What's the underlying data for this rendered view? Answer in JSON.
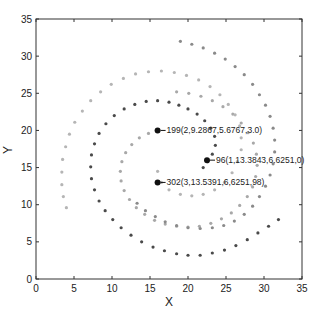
{
  "chart_data": {
    "type": "scatter",
    "title": "",
    "xlabel": "X",
    "ylabel": "Y",
    "xlim": [
      0,
      35
    ],
    "ylim": [
      0,
      35
    ],
    "xticks": [
      0,
      5,
      10,
      15,
      20,
      25,
      30,
      35
    ],
    "yticks": [
      0,
      5,
      10,
      15,
      20,
      25,
      30,
      35
    ],
    "grid": false,
    "legend": null,
    "series": [
      {
        "name": "spiral-1-inner-dark",
        "color": "#4a4a4a",
        "marker": "dot",
        "description": "Short dark arc from (22,15) up through (24,19) to (16,20)-region, then joins outer dark spiral",
        "points": [
          [
            22,
            15
          ],
          [
            22.6,
            15.8
          ],
          [
            23.2,
            16.8
          ],
          [
            23.6,
            18
          ],
          [
            23.5,
            19.2
          ],
          [
            23,
            20.3
          ],
          [
            22.2,
            21.3
          ],
          [
            21.2,
            22.2
          ],
          [
            20,
            22.9
          ],
          [
            18.8,
            23.4
          ],
          [
            17.5,
            23.8
          ],
          [
            16,
            24
          ],
          [
            14.5,
            23.9
          ],
          [
            13,
            23.5
          ],
          [
            11.6,
            22.9
          ],
          [
            10.3,
            22
          ],
          [
            9.2,
            20.9
          ],
          [
            8.3,
            19.6
          ],
          [
            7.7,
            18.2
          ],
          [
            7.3,
            16.7
          ],
          [
            7.2,
            15.1
          ],
          [
            7.3,
            13.5
          ],
          [
            7.7,
            12
          ],
          [
            8.3,
            10.5
          ],
          [
            9.1,
            9.2
          ],
          [
            10.1,
            8
          ],
          [
            11.2,
            6.9
          ],
          [
            12.5,
            5.9
          ],
          [
            13.9,
            5
          ],
          [
            15.4,
            4.3
          ],
          [
            16.9,
            3.8
          ],
          [
            18.5,
            3.4
          ],
          [
            20,
            3.2
          ],
          [
            21.6,
            3.2
          ],
          [
            23.2,
            3.5
          ],
          [
            24.8,
            3.9
          ],
          [
            26.3,
            4.5
          ],
          [
            27.8,
            5.3
          ],
          [
            29.2,
            6.2
          ],
          [
            30.6,
            7.1
          ],
          [
            31.9,
            8
          ]
        ]
      },
      {
        "name": "spiral-2-inner-light",
        "color": "#a8a8a8",
        "marker": "dot",
        "description": "Light gray spiral from (16,20) counter-clockwise outward to top-left arc",
        "points": [
          [
            16,
            20
          ],
          [
            14.8,
            19.6
          ],
          [
            13.6,
            19
          ],
          [
            12.6,
            18.1
          ],
          [
            11.8,
            17
          ],
          [
            11.3,
            15.8
          ],
          [
            11.1,
            14.5
          ],
          [
            11.2,
            13.2
          ],
          [
            11.6,
            11.9
          ],
          [
            12.3,
            10.7
          ],
          [
            13.2,
            9.6
          ],
          [
            14.3,
            8.7
          ],
          [
            15.6,
            7.9
          ],
          [
            17,
            7.4
          ],
          [
            18.5,
            7.1
          ],
          [
            20,
            7
          ],
          [
            21.5,
            7.1
          ],
          [
            23,
            7.5
          ],
          [
            24.4,
            8.1
          ],
          [
            25.7,
            8.9
          ],
          [
            26.8,
            9.9
          ],
          [
            27.8,
            11.1
          ],
          [
            28.5,
            12.4
          ],
          [
            28.9,
            13.8
          ],
          [
            29.1,
            15.3
          ],
          [
            29,
            16.8
          ],
          [
            28.6,
            18.3
          ],
          [
            27.9,
            19.7
          ],
          [
            27,
            21
          ],
          [
            25.9,
            22.2
          ],
          [
            24.6,
            23.2
          ],
          [
            23.2,
            24
          ],
          [
            21.7,
            24.6
          ],
          [
            20.1,
            25
          ],
          [
            18.5,
            25.2
          ]
        ]
      },
      {
        "name": "spiral-3-outer-light",
        "color": "#b5b5b5",
        "marker": "dot",
        "description": "Outer light-gray arc from center-low through right, top (y≈28) and down left side to (4,10)",
        "points": [
          [
            16,
            14.5
          ],
          [
            16.5,
            13
          ],
          [
            17.5,
            12
          ],
          [
            19,
            11.4
          ],
          [
            20.5,
            11.2
          ],
          [
            22,
            11.4
          ],
          [
            23.5,
            12
          ],
          [
            24.8,
            13
          ],
          [
            25.8,
            14.3
          ],
          [
            26.5,
            15.8
          ],
          [
            27,
            17.4
          ],
          [
            27,
            19
          ],
          [
            26.8,
            20.6
          ],
          [
            26.2,
            22.1
          ],
          [
            25.3,
            23.5
          ],
          [
            24.2,
            24.8
          ],
          [
            22.9,
            25.9
          ],
          [
            21.4,
            26.8
          ],
          [
            19.8,
            27.4
          ],
          [
            18.2,
            27.8
          ],
          [
            16.5,
            28
          ],
          [
            14.8,
            27.9
          ],
          [
            13.1,
            27.6
          ],
          [
            11.5,
            27
          ],
          [
            9.9,
            26.2
          ],
          [
            8.5,
            25.2
          ],
          [
            7.2,
            24
          ],
          [
            6.1,
            22.6
          ],
          [
            5.1,
            21.1
          ],
          [
            4.4,
            19.5
          ],
          [
            3.9,
            17.8
          ],
          [
            3.5,
            16.1
          ],
          [
            3.4,
            14.4
          ],
          [
            3.4,
            12.7
          ],
          [
            3.6,
            11.1
          ],
          [
            4,
            9.6
          ]
        ]
      },
      {
        "name": "spiral-4-outermost-medium",
        "color": "#8a8a8a",
        "marker": "dot",
        "description": "Outermost medium-gray arc from (19,32) clockwise around right side down to bottom (20,7)",
        "points": [
          [
            19,
            32
          ],
          [
            20.5,
            31.6
          ],
          [
            22,
            31.1
          ],
          [
            23.5,
            30.4
          ],
          [
            24.9,
            29.6
          ],
          [
            26.2,
            28.6
          ],
          [
            27.4,
            27.5
          ],
          [
            28.5,
            26.2
          ],
          [
            29.4,
            24.8
          ],
          [
            30.2,
            23.4
          ],
          [
            30.8,
            21.9
          ],
          [
            31.2,
            20.3
          ],
          [
            31.4,
            18.7
          ],
          [
            31.4,
            17.1
          ],
          [
            31.2,
            15.5
          ],
          [
            30.8,
            14
          ],
          [
            30.2,
            12.5
          ],
          [
            29.4,
            11.1
          ],
          [
            28.5,
            9.8
          ],
          [
            27.4,
            8.7
          ],
          [
            26.1,
            7.8
          ],
          [
            24.7,
            7.2
          ],
          [
            23.2,
            6.9
          ],
          [
            21.6,
            6.8
          ],
          [
            20,
            6.9
          ],
          [
            18.5,
            7.2
          ],
          [
            17,
            7.7
          ],
          [
            15.7,
            8.4
          ],
          [
            14.4,
            9.2
          ],
          [
            13.3,
            10.2
          ]
        ]
      }
    ],
    "highlighted_points": [
      {
        "label": "96(1,13.3843,6.6251,0)",
        "x": 22.5,
        "y": 16
      },
      {
        "label": "199(2,9.2867,5.6767,3.0)",
        "x": 16,
        "y": 20
      },
      {
        "label": "302(3,13.5391,6,6251,98)",
        "x": 16,
        "y": 13
      }
    ]
  },
  "axes": {
    "x_title": "X",
    "y_title": "Y"
  }
}
